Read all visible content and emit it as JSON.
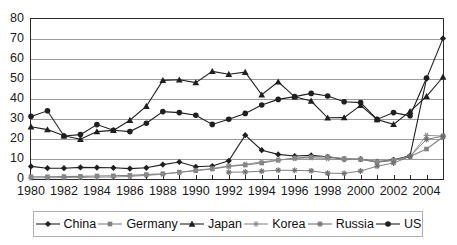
{
  "chart_data": {
    "type": "line",
    "title": "",
    "subtitle": "",
    "xlabel": "",
    "ylabel": "",
    "xlim": [
      1980,
      2005
    ],
    "ylim": [
      0,
      80
    ],
    "ytick_step": 10,
    "yticks": [
      0,
      10,
      20,
      30,
      40,
      50,
      60,
      70,
      80
    ],
    "x": [
      1980,
      1981,
      1982,
      1983,
      1984,
      1985,
      1986,
      1987,
      1988,
      1989,
      1990,
      1991,
      1992,
      1993,
      1994,
      1995,
      1996,
      1997,
      1998,
      1999,
      2000,
      2001,
      2002,
      2003,
      2004,
      2005
    ],
    "xtick_labels": [
      "1980",
      "1982",
      "1984",
      "1986",
      "1988",
      "1990",
      "1992",
      "1994",
      "1996",
      "1998",
      "2000",
      "2002",
      "2004"
    ],
    "xtick_label_values": [
      1980,
      1982,
      1984,
      1986,
      1988,
      1990,
      1992,
      1994,
      1996,
      1998,
      2000,
      2002,
      2004
    ],
    "grid": true,
    "grid_axis": "y",
    "legend_position": "bottom",
    "series": [
      {
        "name": "China",
        "marker": "diamond",
        "color": "#1f1f1f",
        "values": [
          6.3,
          5.4,
          5.4,
          5.8,
          5.7,
          5.6,
          5.2,
          5.6,
          7.2,
          8.5,
          6.1,
          6.5,
          9.1,
          21.9,
          14.4,
          12.3,
          11.5,
          11.8,
          11.1,
          9.9,
          9.9,
          8.6,
          9.6,
          11.6,
          50.2,
          70.3
        ]
      },
      {
        "name": "Germany",
        "marker": "square",
        "color": "#808080",
        "values": [
          1.1,
          1.1,
          1.2,
          1.3,
          1.5,
          1.6,
          1.8,
          2.2,
          2.6,
          3.4,
          4.1,
          5.0,
          6.3,
          7.0,
          8.0,
          9.4,
          10.5,
          11.0,
          11.1,
          10.2,
          9.8,
          8.4,
          9.3,
          11.3,
          15.0,
          21.0
        ]
      },
      {
        "name": "Japan",
        "marker": "triangle",
        "color": "#1f1f1f",
        "values": [
          26.1,
          24.7,
          21.6,
          19.9,
          23.7,
          24.3,
          29.4,
          36.4,
          49.3,
          49.6,
          48.2,
          53.8,
          52.4,
          53.4,
          42.1,
          48.6,
          41.1,
          39.0,
          30.6,
          30.7,
          36.8,
          29.7,
          27.3,
          33.8,
          41.3,
          51.0
        ]
      },
      {
        "name": "Korea",
        "marker": "star",
        "color": "#8a8a8a",
        "values": [
          0.5,
          0.6,
          0.7,
          0.8,
          0.9,
          1.0,
          1.3,
          1.8,
          2.4,
          3.3,
          4.4,
          5.2,
          6.6,
          7.3,
          8.6,
          9.5,
          10.2,
          10.6,
          10.2,
          9.6,
          9.9,
          8.8,
          9.4,
          11.2,
          21.8,
          21.5
        ]
      },
      {
        "name": "Russia",
        "marker": "asterisk",
        "color": "#6f6f6f",
        "values": [
          null,
          null,
          null,
          null,
          null,
          null,
          null,
          null,
          null,
          null,
          null,
          null,
          3.4,
          3.5,
          3.9,
          4.4,
          4.3,
          4.1,
          2.9,
          2.8,
          4.0,
          6.4,
          8.0,
          11.3,
          19.8,
          21.4
        ]
      },
      {
        "name": "US",
        "marker": "circle",
        "color": "#1f1f1f",
        "values": [
          31.3,
          34.1,
          21.5,
          22.2,
          27.2,
          24.4,
          23.7,
          27.9,
          33.7,
          33.2,
          31.9,
          27.3,
          29.9,
          32.8,
          37.0,
          39.8,
          41.2,
          42.8,
          41.5,
          38.6,
          38.2,
          29.8,
          33.2,
          31.6,
          50.5,
          null
        ]
      }
    ]
  }
}
